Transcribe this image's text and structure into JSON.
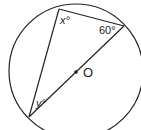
{
  "diagram": {
    "type": "circle-geometry",
    "center_label": "O",
    "angles": {
      "x": "x°",
      "y": "y°",
      "given": "60°"
    },
    "colors": {
      "stroke": "#222222",
      "background": "#ffffff"
    }
  }
}
